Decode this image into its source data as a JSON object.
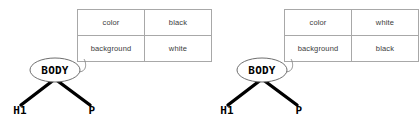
{
  "figure": {
    "background_color": "#ffffff",
    "table_border_color": "#a8a8a8",
    "table_text_color": "#3b3b3b",
    "branch_color": "#000000",
    "ellipse_stroke_color": "#6e6e6e"
  },
  "diagrams": [
    {
      "id": "left",
      "root_label": "BODY",
      "children": [
        {
          "label": "H1"
        },
        {
          "label": "P"
        }
      ],
      "properties": {
        "headers": [
          "property",
          "value"
        ],
        "rows": [
          {
            "property": "color",
            "value": "black"
          },
          {
            "property": "background",
            "value": "white"
          }
        ]
      }
    },
    {
      "id": "right",
      "root_label": "BODY",
      "children": [
        {
          "label": "H1"
        },
        {
          "label": "P"
        }
      ],
      "properties": {
        "headers": [
          "property",
          "value"
        ],
        "rows": [
          {
            "property": "color",
            "value": "white"
          },
          {
            "property": "background",
            "value": "black"
          }
        ]
      }
    }
  ]
}
